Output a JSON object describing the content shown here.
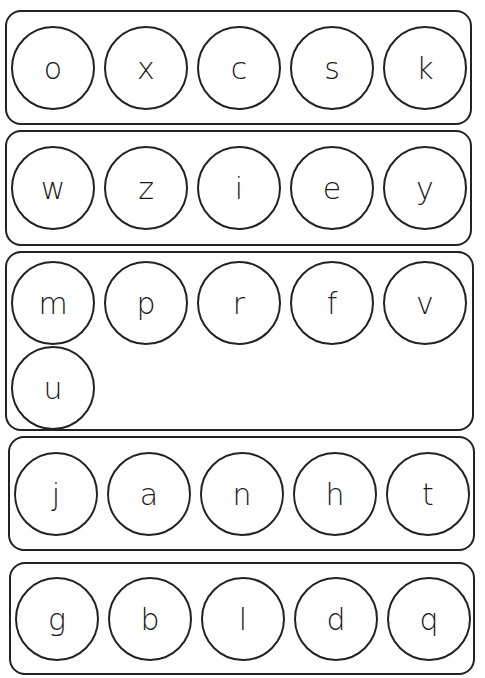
{
  "worksheet": {
    "groups": [
      {
        "letters": [
          "o",
          "x",
          "c",
          "s",
          "k"
        ]
      },
      {
        "letters": [
          "w",
          "z",
          "i",
          "e",
          "y"
        ]
      },
      {
        "letters": [
          "m",
          "p",
          "r",
          "f",
          "v",
          "u"
        ]
      },
      {
        "letters": [
          "j",
          "a",
          "n",
          "h",
          "t"
        ]
      },
      {
        "letters": [
          "g",
          "b",
          "l",
          "d",
          "q"
        ]
      }
    ]
  }
}
